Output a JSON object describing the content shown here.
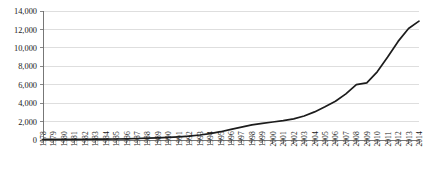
{
  "chart_data": {
    "type": "line",
    "title": "",
    "subtitle": "",
    "xlabel": "",
    "ylabel": "",
    "grid": true,
    "legend": false,
    "legend_position": "none",
    "line_color": "#1c1c1c",
    "grid_color": "#c8c8c8",
    "axis_color": "#555555",
    "ylim": [
      0,
      14000
    ],
    "yticks": [
      0,
      2000,
      4000,
      6000,
      8000,
      10000,
      12000,
      14000
    ],
    "ytick_labels": [
      "0",
      "2,000",
      "4,000",
      "6,000",
      "8,000",
      "10,000",
      "12,000",
      "14,000"
    ],
    "categories": [
      "1978",
      "1979",
      "1980",
      "1981",
      "1982",
      "1983",
      "1984",
      "1985",
      "1986",
      "1987",
      "1988",
      "1989",
      "1990",
      "1991",
      "1992",
      "1993",
      "1994",
      "1995",
      "1996",
      "1997",
      "1998",
      "1999",
      "2000",
      "2001",
      "2002",
      "2003",
      "2004",
      "2005",
      "2006",
      "2007",
      "2008",
      "2009",
      "2010",
      "2011",
      "2012",
      "2013",
      "2014"
    ],
    "values": [
      60,
      65,
      70,
      75,
      80,
      85,
      95,
      110,
      130,
      165,
      200,
      240,
      290,
      350,
      430,
      540,
      700,
      900,
      1150,
      1400,
      1650,
      1800,
      1950,
      2100,
      2300,
      2600,
      3050,
      3600,
      4200,
      5000,
      6000,
      6200,
      7400,
      9000,
      10700,
      12100,
      12900
    ],
    "series_name": "Value"
  }
}
